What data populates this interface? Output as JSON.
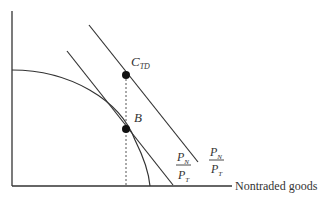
{
  "diagram": {
    "x_axis_label": "Nontraded goods",
    "y_axis_label": "",
    "points": {
      "ctd": {
        "main": "C",
        "sub": "TD"
      },
      "b": {
        "main": "B"
      }
    },
    "price_ratio_inner": {
      "num_main": "P",
      "num_sub": "N",
      "den_main": "P",
      "den_sub": "T"
    },
    "price_ratio_outer": {
      "num_main": "P",
      "num_sub": "N",
      "den_main": "P",
      "den_sub": "T"
    },
    "colors": {
      "line": "#333333",
      "point": "#111111",
      "dashed": "#555555"
    }
  }
}
